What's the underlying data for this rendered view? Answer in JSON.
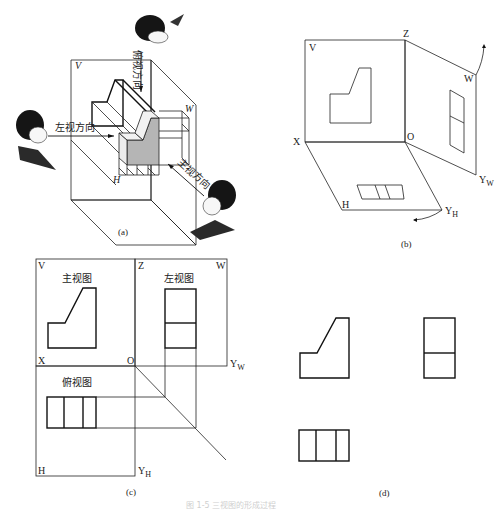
{
  "figure": {
    "caption": "图 1-5 三视图的形成过程",
    "panels": {
      "a": {
        "label": "(a)",
        "planes": {
          "v": "V",
          "w": "W",
          "h": "H"
        },
        "directions": {
          "top": "俯视方向",
          "left": "左视方向",
          "front": "主视方向"
        }
      },
      "b": {
        "label": "(b)",
        "axes": {
          "v": "V",
          "z": "Z",
          "w": "W",
          "x": "X",
          "o": "O",
          "h": "H",
          "yw": "Y",
          "yw_sub": "W",
          "yh": "Y",
          "yh_sub": "H"
        }
      },
      "c": {
        "label": "(c)",
        "axes": {
          "v": "V",
          "z": "Z",
          "w": "W",
          "x": "X",
          "o": "O",
          "yw": "Y",
          "yw_sub": "W",
          "h": "H",
          "yh": "Y",
          "yh_sub": "H"
        },
        "views": {
          "front": "主视图",
          "left": "左视图",
          "top": "俯视图"
        }
      },
      "d": {
        "label": "(d)"
      }
    }
  }
}
